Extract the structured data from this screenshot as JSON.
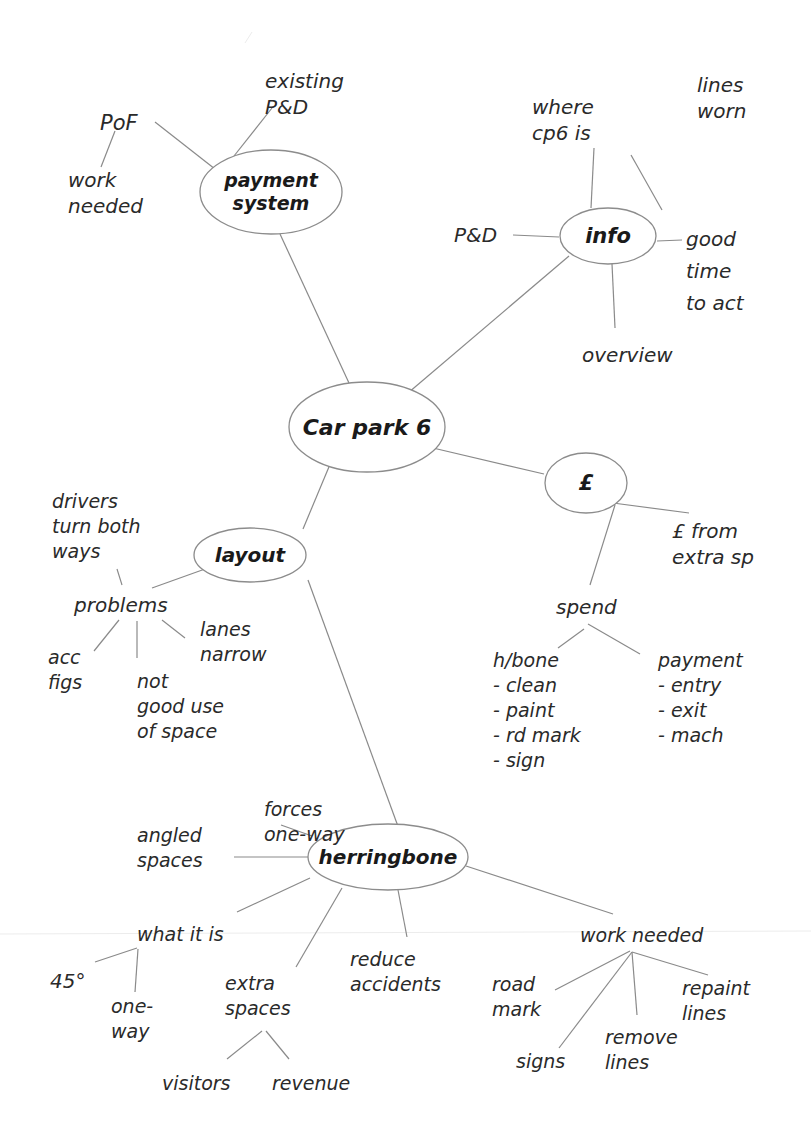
{
  "title": "Car park 6",
  "colors": {
    "line": "#8a8a8a",
    "ellipse_stroke": "#8c8c8c",
    "text": "#1a1a1a"
  },
  "nodes": [
    {
      "id": "center",
      "label": [
        "Car park 6"
      ],
      "x": 367,
      "y": 427,
      "rx": 78,
      "ry": 45,
      "size": 22,
      "bold": true
    },
    {
      "id": "payment",
      "label": [
        "payment",
        "system"
      ],
      "x": 271,
      "y": 192,
      "rx": 71,
      "ry": 42,
      "size": 19,
      "bold": true
    },
    {
      "id": "info",
      "label": [
        "info"
      ],
      "x": 608,
      "y": 236,
      "rx": 48,
      "ry": 28,
      "size": 21,
      "bold": true
    },
    {
      "id": "pound",
      "label": [
        "£"
      ],
      "x": 586,
      "y": 483,
      "rx": 41,
      "ry": 30,
      "size": 21,
      "bold": true
    },
    {
      "id": "layout",
      "label": [
        "layout"
      ],
      "x": 250,
      "y": 555,
      "rx": 56,
      "ry": 27,
      "size": 20,
      "bold": true
    },
    {
      "id": "herringbone",
      "label": [
        "herringbone"
      ],
      "x": 388,
      "y": 857,
      "rx": 80,
      "ry": 33,
      "size": 20,
      "bold": true
    }
  ],
  "leaves": [
    {
      "id": "pof",
      "lines": [
        "PoF"
      ],
      "x": 100,
      "y": 130,
      "size": 21
    },
    {
      "id": "existing-pd",
      "lines": [
        "existing",
        "P&D"
      ],
      "x": 265,
      "y": 88,
      "size": 20
    },
    {
      "id": "pof-work-needed",
      "lines": [
        "work",
        "needed"
      ],
      "x": 68,
      "y": 187,
      "size": 20
    },
    {
      "id": "where-cp6",
      "lines": [
        "where",
        "cp6 is"
      ],
      "x": 532,
      "y": 114,
      "size": 20
    },
    {
      "id": "lines-worn",
      "lines": [
        "lines",
        "worn"
      ],
      "x": 697,
      "y": 92,
      "size": 20
    },
    {
      "id": "info-pd",
      "lines": [
        "P&D"
      ],
      "x": 454,
      "y": 242,
      "size": 20
    },
    {
      "id": "good-time",
      "lines": [
        "good",
        "time",
        "to act"
      ],
      "x": 686,
      "y": 246,
      "size": 20,
      "lh": 32
    },
    {
      "id": "overview",
      "lines": [
        "overview"
      ],
      "x": 582,
      "y": 362,
      "size": 20
    },
    {
      "id": "pound-extra",
      "lines": [
        "£ from",
        "extra sp"
      ],
      "x": 672,
      "y": 538,
      "size": 20
    },
    {
      "id": "spend",
      "lines": [
        "spend"
      ],
      "x": 556,
      "y": 614,
      "size": 20
    },
    {
      "id": "hbone-list",
      "lines": [
        "h/bone",
        "- clean",
        "- paint",
        "- rd mark",
        "- sign"
      ],
      "x": 493,
      "y": 667,
      "size": 19,
      "lh": 25
    },
    {
      "id": "payment-list",
      "lines": [
        "payment",
        "  - entry",
        "  - exit",
        "  - mach"
      ],
      "x": 658,
      "y": 667,
      "size": 19,
      "lh": 25
    },
    {
      "id": "drivers",
      "lines": [
        "drivers",
        "turn both",
        "ways"
      ],
      "x": 52,
      "y": 508,
      "size": 19,
      "lh": 25
    },
    {
      "id": "problems",
      "lines": [
        "problems"
      ],
      "x": 74,
      "y": 612,
      "size": 20
    },
    {
      "id": "acc-figs",
      "lines": [
        "acc",
        "figs"
      ],
      "x": 48,
      "y": 664,
      "size": 19,
      "lh": 25
    },
    {
      "id": "not-good-use",
      "lines": [
        "not",
        "good use",
        "of space"
      ],
      "x": 137,
      "y": 688,
      "size": 19,
      "lh": 25
    },
    {
      "id": "lanes-narrow",
      "lines": [
        "lanes",
        "narrow"
      ],
      "x": 200,
      "y": 636,
      "size": 19,
      "lh": 25
    },
    {
      "id": "forces-one-way",
      "lines": [
        "forces",
        "one-way"
      ],
      "x": 264,
      "y": 816,
      "size": 19,
      "lh": 25
    },
    {
      "id": "angled-spaces",
      "lines": [
        "angled",
        "spaces"
      ],
      "x": 137,
      "y": 842,
      "size": 19,
      "lh": 25
    },
    {
      "id": "what-it-is",
      "lines": [
        "what it is"
      ],
      "x": 137,
      "y": 941,
      "size": 19
    },
    {
      "id": "deg45",
      "lines": [
        "45°"
      ],
      "x": 50,
      "y": 988,
      "size": 20
    },
    {
      "id": "one-way",
      "lines": [
        "one-",
        "way"
      ],
      "x": 111,
      "y": 1013,
      "size": 19,
      "lh": 25
    },
    {
      "id": "extra-spaces",
      "lines": [
        "extra",
        "spaces"
      ],
      "x": 225,
      "y": 990,
      "size": 19,
      "lh": 25
    },
    {
      "id": "reduce-accidents",
      "lines": [
        "reduce",
        "accidents"
      ],
      "x": 350,
      "y": 966,
      "size": 19,
      "lh": 25
    },
    {
      "id": "visitors",
      "lines": [
        "visitors"
      ],
      "x": 162,
      "y": 1090,
      "size": 19
    },
    {
      "id": "revenue",
      "lines": [
        "revenue"
      ],
      "x": 272,
      "y": 1090,
      "size": 19
    },
    {
      "id": "work-needed",
      "lines": [
        "work needed"
      ],
      "x": 580,
      "y": 942,
      "size": 19
    },
    {
      "id": "road-mark",
      "lines": [
        "road",
        "mark"
      ],
      "x": 492,
      "y": 991,
      "size": 19,
      "lh": 25
    },
    {
      "id": "repaint-lines",
      "lines": [
        "repaint",
        "lines"
      ],
      "x": 682,
      "y": 995,
      "size": 19,
      "lh": 25
    },
    {
      "id": "remove-lines",
      "lines": [
        "remove",
        "lines"
      ],
      "x": 605,
      "y": 1044,
      "size": 19,
      "lh": 25
    },
    {
      "id": "signs",
      "lines": [
        "signs"
      ],
      "x": 516,
      "y": 1068,
      "size": 19
    }
  ],
  "edges": [
    [
      349,
      383,
      280,
      234
    ],
    [
      229,
      180,
      155,
      122
    ],
    [
      234,
      156,
      272,
      108
    ],
    [
      115,
      131,
      101,
      167
    ],
    [
      408,
      393,
      569,
      256
    ],
    [
      631,
      155,
      662,
      210
    ],
    [
      594,
      148,
      591,
      208
    ],
    [
      513,
      235,
      559,
      237
    ],
    [
      657,
      241,
      682,
      240
    ],
    [
      612,
      264,
      615,
      328
    ],
    [
      433,
      448,
      544,
      474
    ],
    [
      613,
      503,
      689,
      513
    ],
    [
      615,
      505,
      590,
      585
    ],
    [
      584,
      629,
      558,
      648
    ],
    [
      588,
      624,
      640,
      654
    ],
    [
      331,
      462,
      303,
      529
    ],
    [
      308,
      580,
      407,
      851
    ],
    [
      205,
      569,
      152,
      588
    ],
    [
      122,
      585,
      117,
      569
    ],
    [
      119,
      620,
      94,
      651
    ],
    [
      137,
      621,
      137,
      658
    ],
    [
      162,
      620,
      185,
      638
    ],
    [
      281,
      825,
      312,
      836
    ],
    [
      234,
      857,
      308,
      857
    ],
    [
      310,
      878,
      237,
      912
    ],
    [
      342,
      888,
      296,
      967
    ],
    [
      398,
      890,
      407,
      937
    ],
    [
      466,
      866,
      613,
      914
    ],
    [
      137,
      948,
      95,
      962
    ],
    [
      138,
      949,
      135,
      992
    ],
    [
      262,
      1031,
      227,
      1059
    ],
    [
      266,
      1031,
      289,
      1059
    ],
    [
      630,
      951,
      555,
      990
    ],
    [
      632,
      952,
      559,
      1048
    ],
    [
      632,
      952,
      637,
      1015
    ],
    [
      632,
      952,
      708,
      975
    ]
  ]
}
